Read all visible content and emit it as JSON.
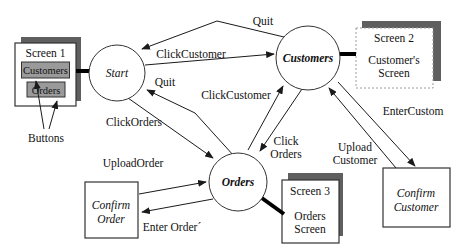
{
  "diagram": {
    "states": {
      "start": {
        "label": "Start"
      },
      "customers": {
        "label": "Customers"
      },
      "orders": {
        "label": "Orders"
      }
    },
    "screens": {
      "screen1": {
        "title": "Screen 1",
        "buttons": {
          "customers": "Customers",
          "orders": "Orders"
        }
      },
      "screen2": {
        "title": "Screen 2",
        "line1": "Customer's",
        "line2": "Screen"
      },
      "screen3": {
        "title": "Screen 3",
        "line1": "Orders",
        "line2": "Screen"
      },
      "confirm_order": {
        "line1": "Confirm",
        "line2": "Order"
      },
      "confirm_customer": {
        "line1": "Confirm",
        "line2": "Customer"
      }
    },
    "edge_labels": {
      "quit_top": "Quit",
      "click_customer_top": "ClickCustomer",
      "quit_mid": "Quit",
      "click_customer_mid": "ClickCustomer",
      "click_orders": "ClickOrders",
      "upload_order": "UploadOrder",
      "click_orders_mid_1": "Click",
      "click_orders_mid_2": "Orders",
      "upload_customer_1": "Upload",
      "upload_customer_2": "Customer",
      "enter_custom": "EnterCustom",
      "enter_order": "Enter Order´",
      "buttons_note": "Buttons"
    },
    "transitions": [
      {
        "from": "Customers",
        "to": "Start",
        "label": "Quit"
      },
      {
        "from": "Start",
        "to": "Customers",
        "label": "ClickCustomer"
      },
      {
        "from": "Orders",
        "to": "Start",
        "label": "Quit"
      },
      {
        "from": "Start",
        "to": "Orders",
        "label": "ClickOrders"
      },
      {
        "from": "Orders",
        "to": "Customers",
        "label": "ClickCustomer"
      },
      {
        "from": "Customers",
        "to": "Orders",
        "label": "Click Orders"
      },
      {
        "from": "Confirm Customer",
        "to": "Customers",
        "label": "Upload Customer"
      },
      {
        "from": "Customers",
        "to": "Confirm Customer",
        "label": "EnterCustom"
      },
      {
        "from": "Confirm Order",
        "to": "Orders",
        "label": "UploadOrder"
      },
      {
        "from": "Orders",
        "to": "Confirm Order",
        "label": "Enter Order´"
      }
    ],
    "colors": {
      "shadow": "#5f5f5f",
      "button_fill": "#9a9a9a",
      "line": "#1a1a1a",
      "background": "#ffffff"
    }
  }
}
